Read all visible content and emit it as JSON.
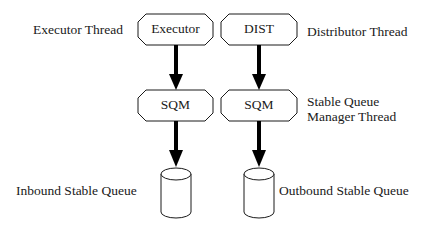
{
  "diagram": {
    "nodes": [
      {
        "id": "executor",
        "label": "Executor",
        "shape": "octagon"
      },
      {
        "id": "dist",
        "label": "DIST",
        "shape": "octagon"
      },
      {
        "id": "sqm_left",
        "label": "SQM",
        "shape": "octagon"
      },
      {
        "id": "sqm_right",
        "label": "SQM",
        "shape": "octagon"
      },
      {
        "id": "inbound_queue",
        "label": "",
        "shape": "cylinder"
      },
      {
        "id": "outbound_queue",
        "label": "",
        "shape": "cylinder"
      }
    ],
    "edges": [
      {
        "from": "executor",
        "to": "sqm_left"
      },
      {
        "from": "dist",
        "to": "sqm_right"
      },
      {
        "from": "sqm_left",
        "to": "inbound_queue"
      },
      {
        "from": "sqm_right",
        "to": "outbound_queue"
      }
    ],
    "annotations": {
      "executor_thread": "Executor Thread",
      "distributor_thread": "Distributor Thread",
      "sqm_thread_line1": "Stable Queue",
      "sqm_thread_line2": "Manager Thread",
      "inbound_queue": "Inbound Stable Queue",
      "outbound_queue": "Outbound Stable Queue"
    },
    "colors": {
      "stroke": "#1a1a1a",
      "fill": "#ffffff",
      "arrow": "#000000"
    }
  }
}
